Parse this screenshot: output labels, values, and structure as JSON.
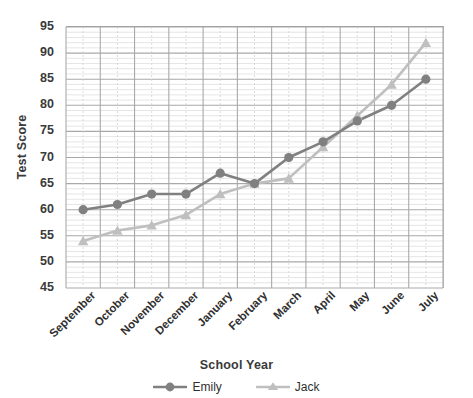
{
  "chart_data": {
    "type": "line",
    "title": "",
    "xlabel": "School Year",
    "ylabel": "Test Score",
    "categories": [
      "September",
      "October",
      "November",
      "December",
      "January",
      "February",
      "March",
      "April",
      "May",
      "June",
      "July"
    ],
    "series": [
      {
        "name": "Emily",
        "color": "#808080",
        "marker": "circle",
        "values": [
          60,
          61,
          63,
          63,
          67,
          65,
          70,
          73,
          77,
          80,
          85
        ]
      },
      {
        "name": "Jack",
        "color": "#bfbfbf",
        "marker": "triangle",
        "values": [
          54,
          56,
          57,
          59,
          63,
          65,
          66,
          72,
          78,
          84,
          92
        ]
      }
    ],
    "ylim": [
      45,
      95
    ],
    "ytick_step": 5,
    "yticks": [
      95,
      90,
      85,
      80,
      75,
      70,
      65,
      60,
      55,
      50,
      45
    ],
    "minor_gridline_step": 1,
    "grid": true,
    "legend_position": "bottom"
  },
  "axis": {
    "y_title": "Test Score",
    "x_title": "School Year"
  },
  "legend": {
    "items": [
      {
        "label": "Emily"
      },
      {
        "label": "Jack"
      }
    ]
  }
}
